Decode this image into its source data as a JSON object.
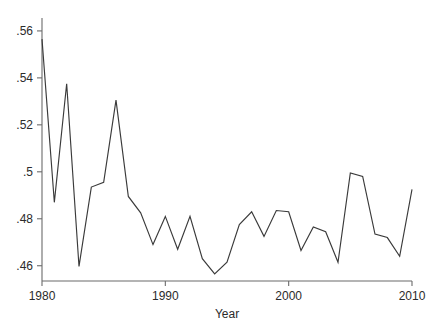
{
  "chart_data": {
    "type": "line",
    "title": "",
    "subtitle": "",
    "xlabel": "Year",
    "ylabel": "",
    "xlim": [
      1980,
      2010
    ],
    "ylim": [
      0.4535,
      0.5655
    ],
    "grid": false,
    "legend": false,
    "line_color": "#3a3a3a",
    "axis_color": "#6b6b6b",
    "x": [
      1980,
      1981,
      1982,
      1983,
      1984,
      1985,
      1986,
      1987,
      1988,
      1989,
      1990,
      1991,
      1992,
      1993,
      1994,
      1995,
      1996,
      1997,
      1998,
      1999,
      2000,
      2001,
      2002,
      2003,
      2004,
      2005,
      2006,
      2007,
      2008,
      2009,
      2010
    ],
    "values": [
      0.5565,
      0.487,
      0.5375,
      0.4597,
      0.4935,
      0.4955,
      0.5305,
      0.4895,
      0.4825,
      0.469,
      0.481,
      0.467,
      0.481,
      0.463,
      0.4565,
      0.4615,
      0.4775,
      0.483,
      0.4725,
      0.4835,
      0.483,
      0.4665,
      0.4765,
      0.4745,
      0.4615,
      0.4995,
      0.498,
      0.4735,
      0.472,
      0.464,
      0.4925
    ],
    "series": [
      {
        "name": "value",
        "values": [
          0.5565,
          0.487,
          0.5375,
          0.4597,
          0.4935,
          0.4955,
          0.5305,
          0.4895,
          0.4825,
          0.469,
          0.481,
          0.467,
          0.481,
          0.463,
          0.4565,
          0.4615,
          0.4775,
          0.483,
          0.4725,
          0.4835,
          0.483,
          0.4665,
          0.4765,
          0.4745,
          0.4615,
          0.4995,
          0.498,
          0.4735,
          0.472,
          0.464,
          0.4925
        ]
      }
    ],
    "y_ticks": [
      0.46,
      0.48,
      0.5,
      0.52,
      0.54,
      0.56
    ],
    "y_tick_labels": [
      ".46",
      ".48",
      ".5",
      ".52",
      ".54",
      ".56"
    ],
    "x_ticks": [
      1980,
      1990,
      2000,
      2010
    ],
    "x_tick_labels": [
      "1980",
      "1990",
      "2000",
      "2010"
    ]
  }
}
